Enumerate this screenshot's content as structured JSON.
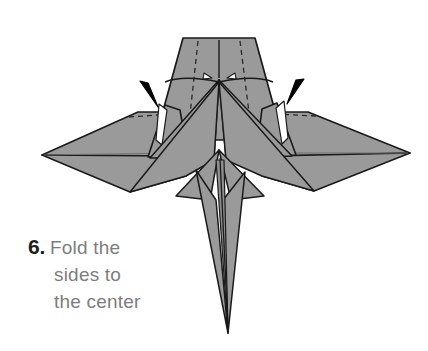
{
  "page": {
    "background_color": "#ffffff",
    "width": 428,
    "height": 351
  },
  "figure": {
    "paper_fill_color": "#9a9a9a",
    "paper_fill_color_light": "#a8a8a8",
    "outline_color": "#1a1a1a",
    "crease_line_color": "#1a1a1a",
    "soft_crease_color": "#6f6f6f",
    "dashed_fold_color": "#2a2a2a",
    "arrow_color": "#000000",
    "highlight_color": "#ffffff",
    "arrows": [
      {
        "name": "left-fold-arrow",
        "direction": "down-right",
        "tip_x": 156,
        "tip_y": 107
      },
      {
        "name": "right-fold-arrow",
        "direction": "down-left",
        "tip_x": 288,
        "tip_y": 103
      }
    ]
  },
  "caption": {
    "step_number": "6.",
    "lines": [
      "Fold the",
      "sides to",
      "the center"
    ],
    "full_text": "6. Fold the sides to the center",
    "text_color": "#7d7d7d",
    "number_color": "#1d1d1d"
  }
}
